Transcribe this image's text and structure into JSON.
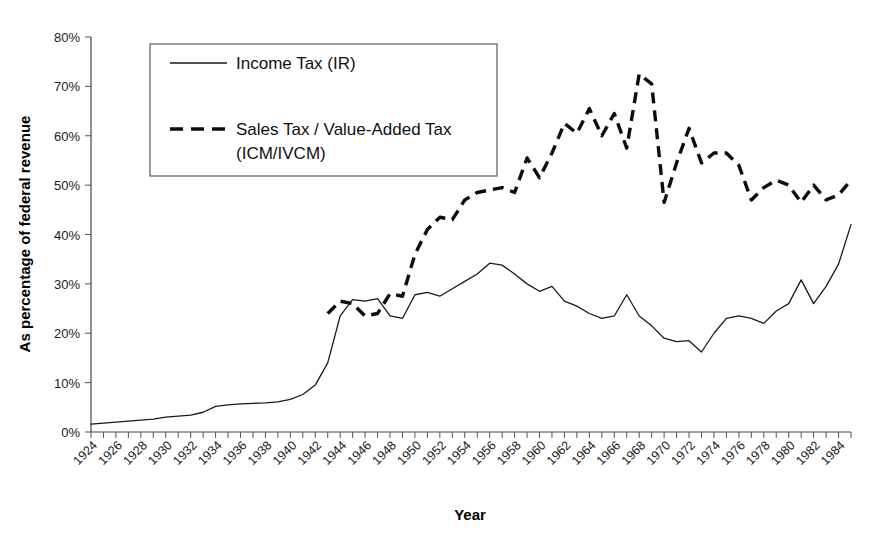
{
  "chart_data": {
    "type": "line",
    "title": "",
    "xlabel": "Year",
    "ylabel": "As percentage of federal revenue",
    "xlim": [
      1924,
      1985
    ],
    "ylim": [
      0,
      80
    ],
    "y_tick_step": 10,
    "x_tick_step": 1,
    "x_label_step": 2,
    "grid": false,
    "legend_position": "top-left-inside",
    "y_tick_labels": [
      "0%",
      "10%",
      "20%",
      "30%",
      "40%",
      "50%",
      "60%",
      "70%",
      "80%"
    ],
    "x_tick_labels": [
      "1924",
      "1926",
      "1928",
      "1930",
      "1932",
      "1934",
      "1936",
      "1938",
      "1940",
      "1942",
      "1944",
      "1946",
      "1948",
      "1950",
      "1952",
      "1954",
      "1956",
      "1958",
      "1960",
      "1962",
      "1964",
      "1966",
      "1968",
      "1970",
      "1972",
      "1974",
      "1976",
      "1978",
      "1980",
      "1982",
      "1984"
    ],
    "x": [
      1924,
      1925,
      1926,
      1927,
      1928,
      1929,
      1930,
      1931,
      1932,
      1933,
      1934,
      1935,
      1936,
      1937,
      1938,
      1939,
      1940,
      1941,
      1942,
      1943,
      1944,
      1945,
      1946,
      1947,
      1948,
      1949,
      1950,
      1951,
      1952,
      1953,
      1954,
      1955,
      1956,
      1957,
      1958,
      1959,
      1960,
      1961,
      1962,
      1963,
      1964,
      1965,
      1966,
      1967,
      1968,
      1969,
      1970,
      1971,
      1972,
      1973,
      1974,
      1975,
      1976,
      1977,
      1978,
      1979,
      1980,
      1981,
      1982,
      1983,
      1984,
      1985
    ],
    "series": [
      {
        "name": "Income Tax (IR)",
        "key": "income_tax",
        "style": "solid",
        "color": "#1a1a1a",
        "values": [
          1.6,
          1.8,
          2.0,
          2.2,
          2.4,
          2.6,
          3.0,
          3.2,
          3.4,
          4.0,
          5.2,
          5.5,
          5.7,
          5.8,
          5.9,
          6.1,
          6.6,
          7.6,
          9.5,
          14.0,
          23.5,
          26.8,
          26.5,
          27.0,
          23.5,
          23.0,
          27.8,
          28.3,
          27.5,
          29.0,
          30.5,
          32.0,
          34.2,
          33.8,
          32.0,
          30.0,
          28.5,
          29.5,
          26.5,
          25.5,
          24.0,
          23.0,
          23.5,
          27.8,
          23.5,
          21.5,
          19.0,
          18.3,
          18.5,
          16.2,
          20.0,
          23.0,
          23.5,
          23.0,
          22.0,
          24.5,
          26.0,
          30.8,
          26.0,
          29.5,
          34.0,
          42.0
        ]
      },
      {
        "name": "Sales Tax / Value-Added Tax (ICM/IVCM)",
        "key": "sales_tax",
        "style": "dashed",
        "color": "#0d0d0d",
        "start_year": 1943,
        "values": [
          null,
          null,
          null,
          null,
          null,
          null,
          null,
          null,
          null,
          null,
          null,
          null,
          null,
          null,
          null,
          null,
          null,
          null,
          null,
          24.0,
          26.5,
          26.0,
          23.5,
          24.0,
          28.0,
          27.5,
          36.0,
          41.0,
          43.5,
          43.0,
          47.0,
          48.5,
          49.0,
          49.5,
          48.5,
          55.5,
          51.5,
          56.5,
          62.5,
          60.5,
          65.5,
          60.0,
          64.5,
          57.5,
          72.5,
          70.5,
          46.5,
          54.5,
          61.5,
          54.5,
          56.5,
          56.5,
          54.0,
          47.0,
          49.5,
          51.0,
          50.0,
          46.5,
          50.0,
          47.0,
          48.0,
          51.0
        ]
      }
    ],
    "notes": {
      "income_peak": {
        "year": 1956,
        "value": 34.2
      },
      "income_min": {
        "year": 1924,
        "value": 1.6
      },
      "income_end": {
        "year": 1985,
        "value": 42.0
      },
      "sales_peak": {
        "year": 1968,
        "value": 72.5
      },
      "sales_start": {
        "year": 1943,
        "value": 24.0
      },
      "sales_end": {
        "year": 1985,
        "value": 51.0
      }
    }
  },
  "legend": {
    "entries": [
      {
        "label_line1": "Income Tax (IR)",
        "label_line2": ""
      },
      {
        "label_line1": "Sales Tax / Value-Added Tax",
        "label_line2": "(ICM/IVCM)"
      }
    ]
  },
  "colors": {
    "background": "#ffffff",
    "axis": "#444444",
    "text": "#111111",
    "series_solid": "#1a1a1a",
    "series_dashed": "#0d0d0d",
    "legend_border": "#5a5a5a"
  }
}
